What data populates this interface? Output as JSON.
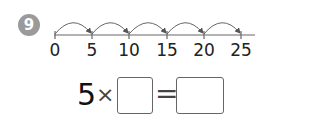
{
  "problem": {
    "number": "9",
    "number_line": {
      "ticks": [
        "0",
        "5",
        "10",
        "15",
        "20",
        "25"
      ],
      "jumps": 5,
      "jump_size": "5"
    },
    "equation": {
      "multiplicand": "5",
      "operator": "×",
      "equals": "=",
      "blank_1": "",
      "blank_2": ""
    }
  }
}
